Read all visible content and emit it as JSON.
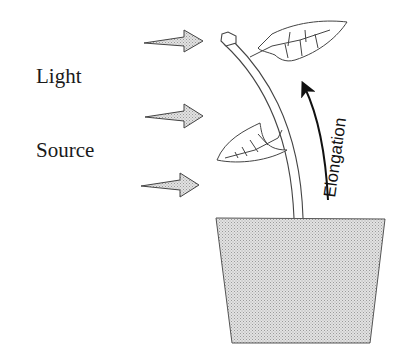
{
  "diagram": {
    "labels": {
      "light": "Light",
      "source": "Source",
      "elongation": "Elongation"
    },
    "elements": [
      {
        "name": "light-arrow",
        "count": 3,
        "direction": "right"
      },
      {
        "name": "plant-stem",
        "description": "curved stem bending toward light"
      },
      {
        "name": "leaf",
        "count": 2
      },
      {
        "name": "flower-pot",
        "shape": "trapezoid",
        "fill": "stippled gray"
      },
      {
        "name": "elongation-arrow",
        "direction": "up along stem"
      }
    ],
    "colors": {
      "stroke": "#333333",
      "pot_fill": "#d4d4d4",
      "arrow_fill": "#cfcfcf",
      "background": "#ffffff"
    }
  }
}
